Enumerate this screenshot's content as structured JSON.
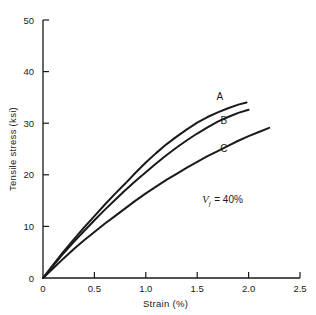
{
  "chart_data": {
    "type": "line",
    "title": "",
    "xlabel": "Strain (%)",
    "ylabel": "Tensile stress (ksi)",
    "xlim": [
      0,
      2.5
    ],
    "ylim": [
      0,
      50
    ],
    "grid": false,
    "legend_position": "inline-curve-labels",
    "xticks": [
      "0",
      "0.5",
      "1.0",
      "1.5",
      "2.0",
      "2.5"
    ],
    "xtick_values": [
      0,
      0.5,
      1.0,
      1.5,
      2.0,
      2.5
    ],
    "yticks": [
      "0",
      "10",
      "20",
      "30",
      "40",
      "50"
    ],
    "ytick_values": [
      0,
      10,
      20,
      30,
      40,
      50
    ],
    "annotations": [
      {
        "name": "fiber-volume-fraction",
        "symbol": "V",
        "subscript": "f",
        "text": "= 40%",
        "full_text": "Vf = 40%",
        "x": 1.55,
        "y": 14.5
      }
    ],
    "series": [
      {
        "name": "A",
        "label": "A",
        "label_x": 1.72,
        "label_y": 34.5,
        "x": [
          0,
          0.1,
          0.2,
          0.3,
          0.4,
          0.5,
          0.6,
          0.7,
          0.8,
          0.9,
          1.0,
          1.1,
          1.2,
          1.3,
          1.4,
          1.5,
          1.6,
          1.7,
          1.8,
          1.9,
          1.98
        ],
        "y": [
          0,
          2.6,
          5.1,
          7.5,
          9.8,
          12.0,
          14.2,
          16.3,
          18.3,
          20.4,
          22.4,
          24.2,
          25.9,
          27.4,
          28.8,
          30.1,
          31.2,
          32.1,
          32.9,
          33.6,
          34.0
        ]
      },
      {
        "name": "B",
        "label": "B",
        "label_x": 1.76,
        "label_y": 29.9,
        "x": [
          0,
          0.1,
          0.2,
          0.3,
          0.4,
          0.5,
          0.6,
          0.7,
          0.8,
          0.9,
          1.0,
          1.1,
          1.2,
          1.3,
          1.4,
          1.5,
          1.6,
          1.7,
          1.8,
          1.9,
          2.0
        ],
        "y": [
          0,
          2.4,
          4.8,
          7.0,
          9.1,
          11.2,
          13.2,
          15.1,
          17.0,
          18.8,
          20.5,
          22.2,
          23.8,
          25.3,
          26.7,
          28.0,
          29.2,
          30.3,
          31.2,
          32.0,
          32.6
        ]
      },
      {
        "name": "C",
        "label": "C",
        "label_x": 1.76,
        "label_y": 24.4,
        "x": [
          0,
          0.1,
          0.2,
          0.3,
          0.4,
          0.5,
          0.6,
          0.7,
          0.8,
          0.9,
          1.0,
          1.1,
          1.2,
          1.3,
          1.4,
          1.5,
          1.6,
          1.7,
          1.8,
          1.9,
          2.0,
          2.1,
          2.2
        ],
        "y": [
          0,
          1.9,
          3.8,
          5.6,
          7.3,
          8.9,
          10.5,
          12.0,
          13.5,
          15.0,
          16.4,
          17.7,
          19.0,
          20.2,
          21.4,
          22.5,
          23.6,
          24.6,
          25.6,
          26.6,
          27.5,
          28.3,
          29.1
        ]
      }
    ]
  }
}
